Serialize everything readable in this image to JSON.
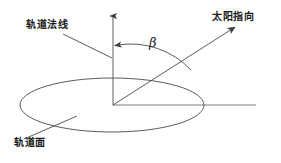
{
  "diagram": {
    "stroke_color": "#4a4a4a",
    "text_color": "#1a1a1a",
    "background_color": "#ffffff",
    "labels": {
      "orbit_normal": "轨道法线",
      "sun_direction": "太阳指向",
      "orbit_plane": "轨道面",
      "beta_angle": "β"
    },
    "geometry": {
      "origin": [
        113,
        105
      ],
      "normal_axis_tip": [
        113,
        12
      ],
      "sun_vector_tip": [
        237,
        25
      ],
      "horizon_line_end": [
        256,
        105
      ],
      "ellipse_center": [
        112,
        105
      ],
      "ellipse_rx": 92,
      "ellipse_ry": 27,
      "beta_arc_radius": 60
    }
  }
}
